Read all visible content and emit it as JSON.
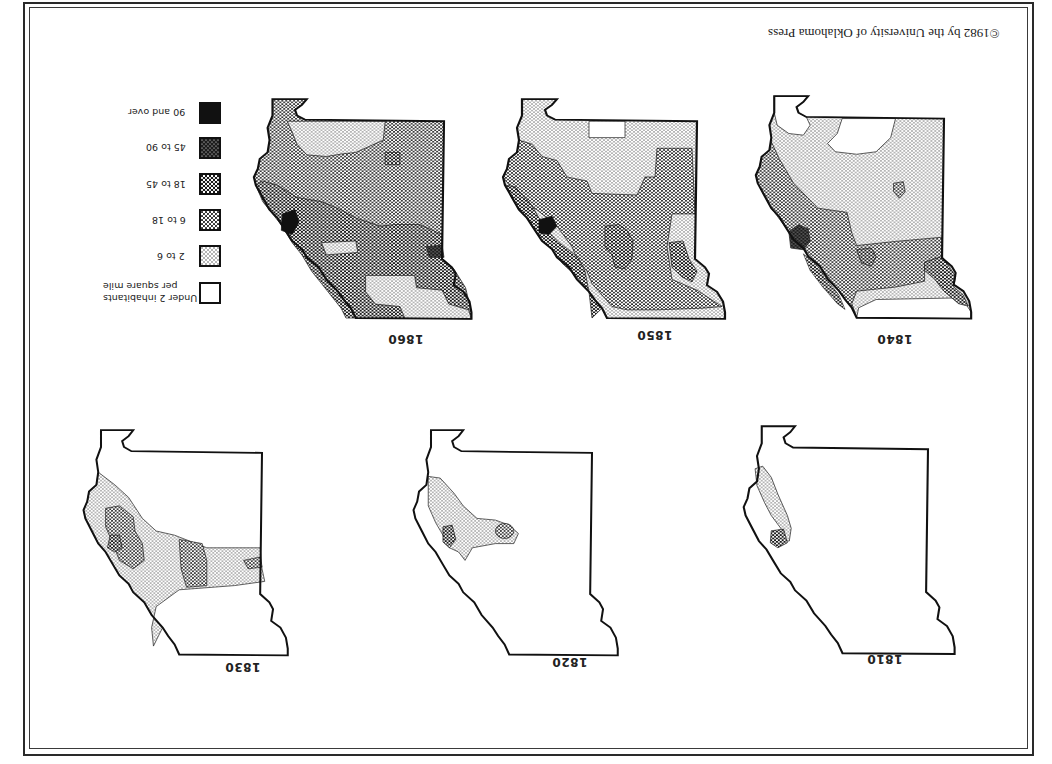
{
  "page": {
    "orientation": "rotated 180 degrees (upside down)",
    "copyright": "©1982 by the University of Oklahoma Press"
  },
  "legend": {
    "title": "Inhabitants per square mile",
    "items": [
      {
        "label": "90 and over",
        "pattern": "solid-black",
        "color": "#111111"
      },
      {
        "label": "45 to 90",
        "pattern": "dense-dark-dots",
        "color": "#2e2e2e"
      },
      {
        "label": "18 to 45",
        "pattern": "checker-medium",
        "color": "#555555"
      },
      {
        "label": "6 to 18",
        "pattern": "dots-medium",
        "color": "#8a8a8a"
      },
      {
        "label": "2 to 6",
        "pattern": "dots-light",
        "color": "#c8c8c8"
      },
      {
        "label": "Under 2 inhabitants per square mile",
        "line1": "Under 2 inhabitants",
        "line2": "per square mile",
        "pattern": "blank",
        "color": "#ffffff"
      }
    ]
  },
  "maps": [
    {
      "year": "1860",
      "position": "top-left"
    },
    {
      "year": "1850",
      "position": "top-center"
    },
    {
      "year": "1840",
      "position": "top-right"
    },
    {
      "year": "1830",
      "position": "bottom-left"
    },
    {
      "year": "1820",
      "position": "bottom-center"
    },
    {
      "year": "1810",
      "position": "bottom-right"
    }
  ]
}
